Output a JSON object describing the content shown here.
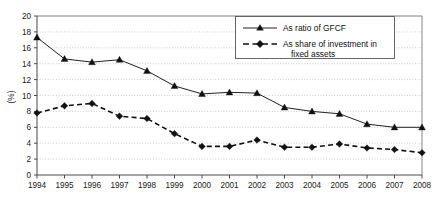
{
  "chart_data": {
    "type": "line",
    "title": "",
    "xlabel": "",
    "ylabel": "(%)",
    "ylim": [
      0,
      20
    ],
    "ytick_step": 2,
    "grid": true,
    "legend_position": "top-right",
    "categories": [
      "1994",
      "1995",
      "1996",
      "1997",
      "1998",
      "1999",
      "2000",
      "2001",
      "2002",
      "2003",
      "2004",
      "2005",
      "2006",
      "2007",
      "2008"
    ],
    "yticks": [
      "0",
      "2",
      "4",
      "6",
      "8",
      "10",
      "12",
      "14",
      "16",
      "18",
      "20"
    ],
    "series": [
      {
        "name": "As ratio of GFCF",
        "marker": "triangle",
        "line_style": "solid",
        "color": "#222222",
        "values": [
          17.3,
          14.6,
          14.2,
          14.5,
          13.1,
          11.2,
          10.2,
          10.4,
          10.3,
          8.5,
          8.0,
          7.7,
          6.4,
          6.0,
          6.0
        ]
      },
      {
        "name": "As share of investment in fixed assets",
        "marker": "diamond",
        "line_style": "dashed",
        "color": "#111111",
        "values": [
          7.8,
          8.7,
          9.0,
          7.4,
          7.1,
          5.2,
          3.6,
          3.6,
          4.4,
          3.5,
          3.5,
          3.9,
          3.4,
          3.2,
          2.8
        ]
      }
    ]
  },
  "legend": {
    "entries": [
      {
        "label": "As ratio of GFCF",
        "label_line2": ""
      },
      {
        "label": "As share of investment in",
        "label_line2": "fixed assets"
      }
    ]
  },
  "axis": {
    "y_title": "(%)"
  }
}
